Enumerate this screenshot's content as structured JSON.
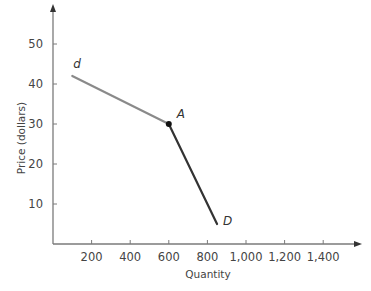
{
  "chart_data": {
    "type": "line",
    "title": "",
    "xlabel": "Quantity",
    "ylabel": "Price (dollars)",
    "xlim": [
      0,
      1600
    ],
    "ylim": [
      0,
      60
    ],
    "x_ticks": [
      200,
      400,
      600,
      800,
      1000,
      1200,
      1400
    ],
    "x_tick_labels": [
      "200",
      "400",
      "600",
      "800",
      "1,000",
      "1,200",
      "1,400"
    ],
    "y_ticks": [
      10,
      20,
      30,
      40,
      50
    ],
    "y_tick_labels": [
      "10",
      "20",
      "30",
      "40",
      "50"
    ],
    "grid": false,
    "legend": null,
    "series": [
      {
        "name": "d",
        "points": [
          {
            "x": 100,
            "y": 42
          },
          {
            "x": 600,
            "y": 30
          }
        ],
        "color": "#8a8a8a"
      },
      {
        "name": "D",
        "points": [
          {
            "x": 600,
            "y": 30
          },
          {
            "x": 850,
            "y": 5
          }
        ],
        "color": "#333333"
      }
    ],
    "annotations": [
      {
        "text": "d",
        "x": 100,
        "y": 42,
        "position": "above"
      },
      {
        "text": "A",
        "x": 600,
        "y": 30,
        "position": "upper-right",
        "marker": "dot"
      },
      {
        "text": "D",
        "x": 850,
        "y": 5,
        "position": "right"
      }
    ]
  },
  "colors": {
    "axis": "#7a7a7a",
    "upper_segment": "#8a8a8a",
    "lower_segment": "#333333",
    "point": "#111111",
    "text": "#444444"
  }
}
